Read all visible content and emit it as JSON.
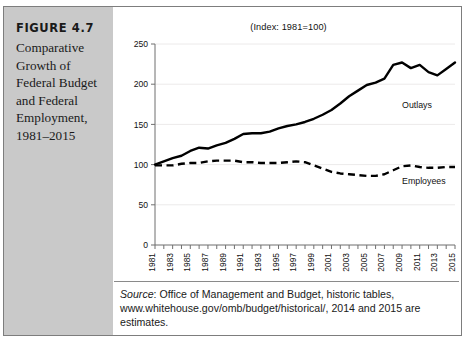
{
  "figure": {
    "number": "FIGURE 4.7",
    "caption": "Comparative\nGrowth of\nFederal Budget\nand Federal\nEmployment,\n1981–2015"
  },
  "source": {
    "label": "Source",
    "text": ": Office of Management and Budget, historic tables, www.whitehouse.gov/omb/budget/historical/, 2014 and 2015 are estimates."
  },
  "chart_data": {
    "type": "line",
    "title": "(Index: 1981=100)",
    "xlabel": "",
    "ylabel": "",
    "xlim": [
      1981,
      2015
    ],
    "ylim": [
      0,
      250
    ],
    "yticks": [
      0,
      50,
      100,
      150,
      200,
      250
    ],
    "ytick_labels": [
      "0",
      "50",
      "100",
      "150",
      "200",
      "250"
    ],
    "xticks": [
      1981,
      1983,
      1985,
      1987,
      1989,
      1991,
      1993,
      1995,
      1997,
      1999,
      2001,
      2003,
      2005,
      2007,
      2009,
      2011,
      2013,
      2015
    ],
    "xtick_labels": [
      "1981",
      "1983",
      "1985",
      "1987",
      "1989",
      "1991",
      "1993",
      "1995",
      "1997",
      "1999",
      "2001",
      "2003",
      "2005",
      "2007",
      "2009",
      "2011",
      "2013",
      "2015"
    ],
    "grid": true,
    "legend_position": "inline-annotation",
    "x": [
      1981,
      1982,
      1983,
      1984,
      1985,
      1986,
      1987,
      1988,
      1989,
      1990,
      1991,
      1992,
      1993,
      1994,
      1995,
      1996,
      1997,
      1998,
      1999,
      2000,
      2001,
      2002,
      2003,
      2004,
      2005,
      2006,
      2007,
      2008,
      2009,
      2010,
      2011,
      2012,
      2013,
      2014,
      2015
    ],
    "series": [
      {
        "name": "Outlays",
        "style": "solid",
        "color": "#000000",
        "label_x": 2009,
        "label_y": 170,
        "values": [
          100,
          104,
          108,
          111,
          117,
          121,
          120,
          124,
          127,
          132,
          138,
          139,
          139,
          141,
          145,
          148,
          150,
          153,
          157,
          162,
          168,
          176,
          185,
          192,
          199,
          202,
          207,
          224,
          227,
          220,
          224,
          215,
          211,
          219,
          227
        ]
      },
      {
        "name": "Employees",
        "style": "dashed",
        "color": "#000000",
        "label_x": 2009,
        "label_y": 76,
        "values": [
          99,
          99,
          99,
          101,
          102,
          102,
          104,
          105,
          105,
          105,
          103,
          103,
          102,
          102,
          102,
          103,
          104,
          103,
          99,
          95,
          91,
          89,
          88,
          87,
          86,
          86,
          88,
          93,
          98,
          99,
          97,
          96,
          96,
          97,
          97
        ]
      }
    ]
  }
}
